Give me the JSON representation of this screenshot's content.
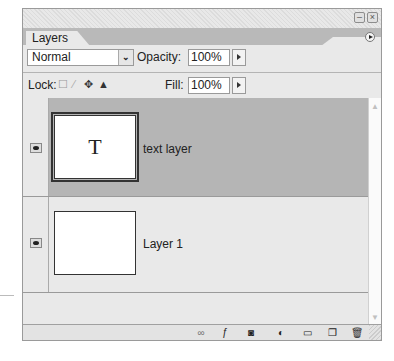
{
  "window": {
    "minimize_icon": "minimize-icon",
    "close_icon": "close-icon",
    "minimize_glyph": "–",
    "close_glyph": "×"
  },
  "panel": {
    "tab_label": "Layers",
    "menu_icon": "panel-menu-icon"
  },
  "blend": {
    "mode": "Normal",
    "chevron": "⌄",
    "opacity_label": "Opacity:",
    "opacity_value": "100%"
  },
  "lock": {
    "label": "Lock:",
    "icons": [
      "lock-transparent-icon",
      "lock-image-icon",
      "lock-position-icon",
      "lock-all-icon"
    ],
    "glyphs": [
      "☐",
      "⁄",
      "✥",
      "▲"
    ],
    "fill_label": "Fill:",
    "fill_value": "100%"
  },
  "layers": [
    {
      "name": "text layer",
      "thumbnail_glyph": "T",
      "visible": true,
      "selected": true
    },
    {
      "name": "Layer 1",
      "thumbnail_glyph": "",
      "visible": true,
      "selected": false
    }
  ],
  "scrollbar": {
    "up": "▲",
    "down": "▼"
  },
  "toolbar": {
    "items": [
      {
        "name": "link-layers-icon",
        "glyph": "∞"
      },
      {
        "name": "layer-style-icon",
        "glyph": "ƒ"
      },
      {
        "name": "layer-mask-icon",
        "glyph": "◙"
      },
      {
        "name": "adjustment-layer-icon",
        "glyph": "◐"
      },
      {
        "name": "new-group-icon",
        "glyph": "▭"
      },
      {
        "name": "new-layer-icon",
        "glyph": "❐"
      },
      {
        "name": "delete-layer-icon",
        "glyph": "🗑"
      }
    ]
  },
  "colors": {
    "panel_bg": "#e9e9e9",
    "selected_row": "#b5b5b5",
    "tab_strip": "#b9b9b9"
  }
}
